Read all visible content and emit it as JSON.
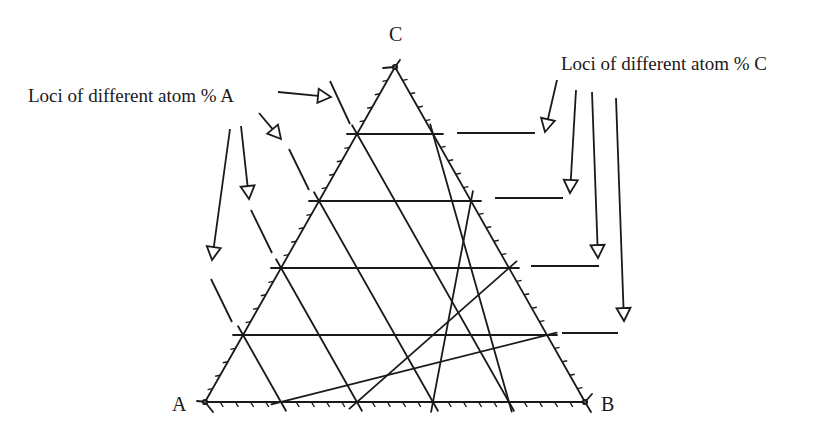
{
  "figure": {
    "type": "ternary-phase-diagram-grid",
    "vertices": {
      "A": {
        "label": "A"
      },
      "B": {
        "label": "B"
      },
      "C": {
        "label": "C"
      }
    },
    "annotations": {
      "left": "Loci of different atom % A",
      "right": "Loci of different atom % C"
    },
    "grid": {
      "divisions": 5,
      "minor_ticks_per_division": 4
    },
    "colors": {
      "line": "#1a1a1a",
      "background": "#ffffff"
    }
  }
}
